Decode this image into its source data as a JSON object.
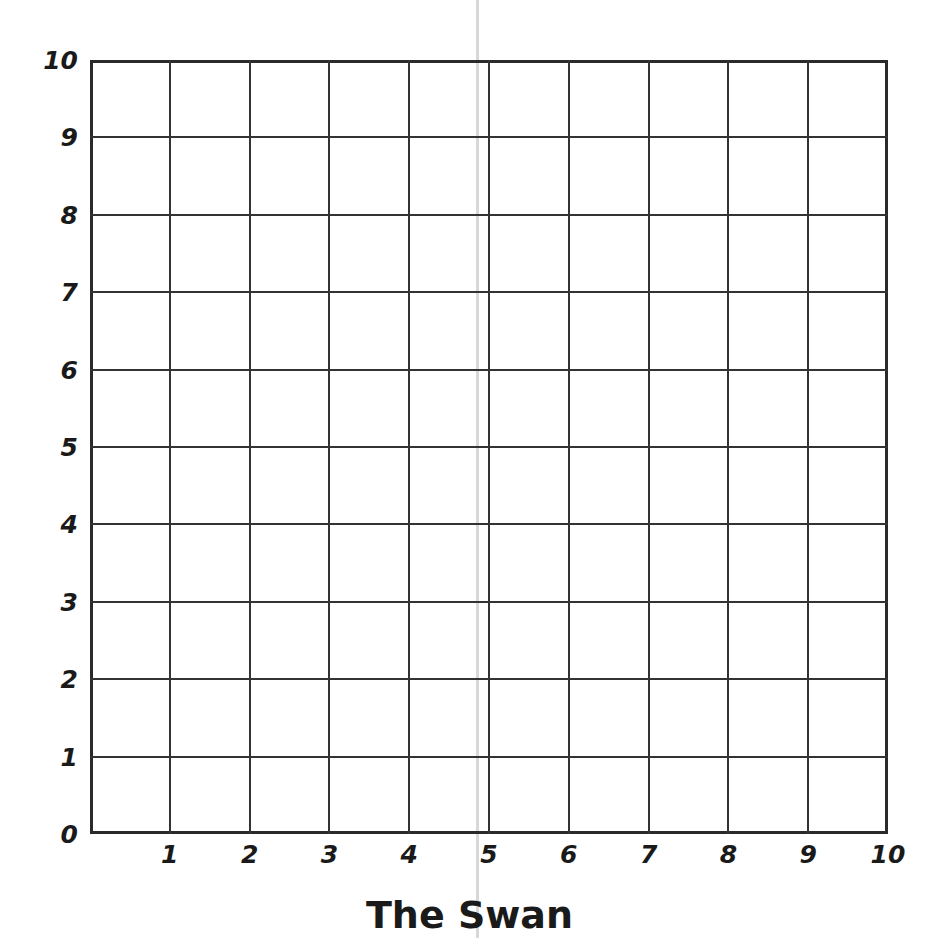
{
  "title": "The Swan",
  "grid": {
    "x_min": 0,
    "x_max": 10,
    "y_min": 0,
    "y_max": 10,
    "x_ticks": [
      "1",
      "2",
      "3",
      "4",
      "5",
      "6",
      "7",
      "8",
      "9",
      "10"
    ],
    "y_ticks": [
      "0",
      "1",
      "2",
      "3",
      "4",
      "5",
      "6",
      "7",
      "8",
      "9",
      "10"
    ],
    "line_color": "#333333",
    "border_color": "#2a2a2a",
    "fold_line_color": "#d8d8d8"
  }
}
